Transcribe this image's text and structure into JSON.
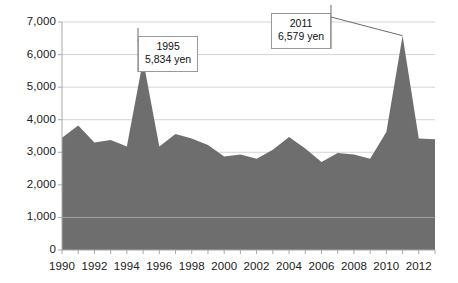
{
  "chart_data": {
    "type": "area",
    "title": "",
    "subtitle": "",
    "xlabel": "",
    "ylabel": "",
    "x": [
      1990,
      1991,
      1992,
      1993,
      1994,
      1995,
      1996,
      1997,
      1998,
      1999,
      2000,
      2001,
      2002,
      2003,
      2004,
      2005,
      2006,
      2007,
      2008,
      2009,
      2010,
      2011,
      2012,
      2013
    ],
    "values": [
      3450,
      3820,
      3300,
      3380,
      3180,
      5834,
      3180,
      3560,
      3420,
      3220,
      2870,
      2930,
      2800,
      3080,
      3470,
      3120,
      2700,
      2980,
      2930,
      2800,
      3620,
      6579,
      3420,
      3400
    ],
    "series": [
      {
        "name": "yen",
        "values": [
          3450,
          3820,
          3300,
          3380,
          3180,
          5834,
          3180,
          3560,
          3420,
          3220,
          2870,
          2930,
          2800,
          3080,
          3470,
          3120,
          2700,
          2980,
          2930,
          2800,
          3620,
          6579,
          3420,
          3400
        ]
      }
    ],
    "ylim": [
      0,
      7000
    ],
    "xlim": [
      1990,
      2013
    ],
    "ytick_labels": [
      "7,000",
      "6,000",
      "5,000",
      "4,000",
      "3,000",
      "2,000",
      "1,000",
      "0"
    ],
    "ytick_values": [
      7000,
      6000,
      5000,
      4000,
      3000,
      2000,
      1000,
      0
    ],
    "xtick_labels": [
      "1990",
      "1992",
      "1994",
      "1996",
      "1998",
      "2000",
      "2002",
      "2004",
      "2006",
      "2008",
      "2010",
      "2012"
    ],
    "xtick_values": [
      1990,
      1992,
      1994,
      1996,
      1998,
      2000,
      2002,
      2004,
      2006,
      2008,
      2010,
      2012
    ],
    "grid": true,
    "legend": "none",
    "annotations": [
      {
        "year": "1995",
        "value": "5,834 yen",
        "point_x": 1995,
        "point_y": 5834
      },
      {
        "year": "2011",
        "value": "6,579 yen",
        "point_x": 2011,
        "point_y": 6579
      }
    ],
    "colors": {
      "fill": "#6e6e6e",
      "grid": "#d4d4d4",
      "axis": "#a8a8a8",
      "text": "#202020",
      "callout_border": "#9a9a9a",
      "callout_bg": "#ffffff",
      "background": "#ffffff"
    }
  }
}
